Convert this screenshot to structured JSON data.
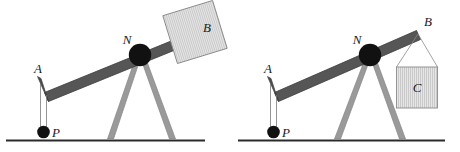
{
  "figure": {
    "background_color": "#ffffff",
    "panel_count": 2
  },
  "style": {
    "beam_color": "#565656",
    "beam_edge_color": "#3b3b3b",
    "support_color": "#9a9a9a",
    "support_edge_color": "#7d7d7d",
    "pivot_color": "#111111",
    "ball_color": "#111111",
    "ground_color": "#2b2b2b",
    "string_color": "#6e6e6e",
    "block_fill": "#e4e4e4",
    "block_edge": "#8a8a8a",
    "hatch_color": "#b8b8b8",
    "label_color": "#1a1a1a"
  },
  "panels": [
    {
      "name": "left-diagram",
      "caption": "",
      "labels": {
        "beam_left_end": "A",
        "pivot": "N",
        "beam_right_end": "B",
        "hanging_ball": "P"
      },
      "load": {
        "kind": "tilted-block-on-beam-end",
        "label": "B",
        "tilt_degrees": -17
      },
      "ball": {
        "label": "P",
        "attached_at": "A"
      },
      "support": {
        "kind": "a-frame-tripod",
        "legs": 2
      },
      "ground": {
        "visible": true
      }
    },
    {
      "name": "right-diagram",
      "caption": "",
      "labels": {
        "beam_left_end": "A",
        "pivot": "N",
        "beam_right_end": "B",
        "hanging_ball": "P",
        "hanging_block": "C"
      },
      "load": {
        "kind": "block-suspended-by-strings",
        "label": "C",
        "tilt_degrees": 0,
        "strings": 2
      },
      "ball": {
        "label": "P",
        "attached_at": "A"
      },
      "support": {
        "kind": "a-frame-tripod",
        "legs": 2
      },
      "ground": {
        "visible": true
      }
    }
  ]
}
